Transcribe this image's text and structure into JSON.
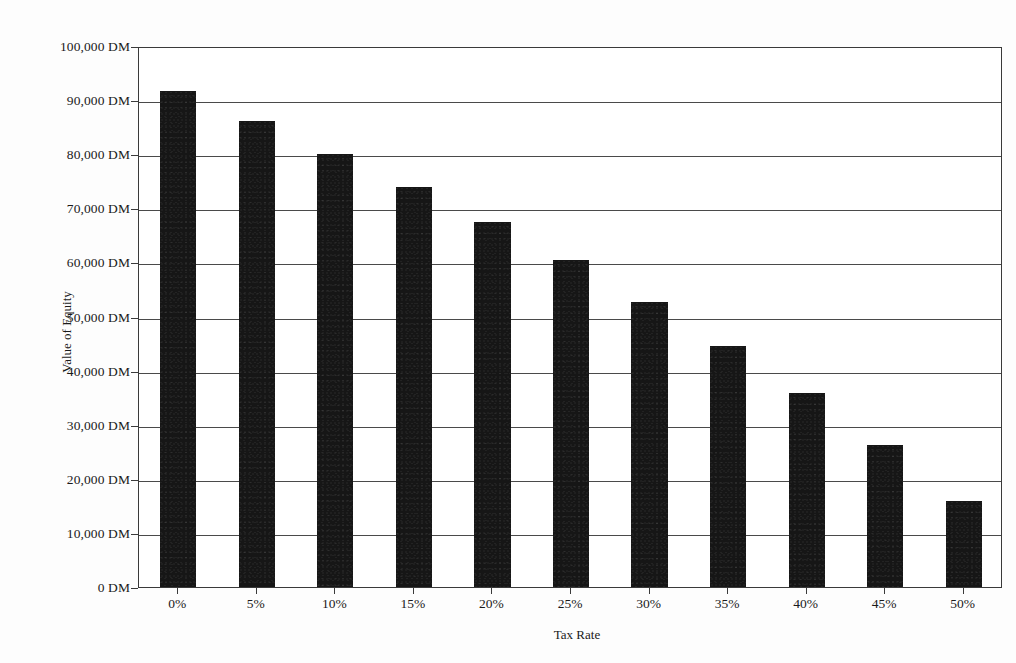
{
  "chart_data": {
    "type": "bar",
    "title": "",
    "subtitle": "",
    "xlabel": "Tax Rate",
    "ylabel": "Value of Equity",
    "categories": [
      "0%",
      "5%",
      "10%",
      "15%",
      "20%",
      "25%",
      "30%",
      "35%",
      "40%",
      "45%",
      "50%"
    ],
    "values": [
      91700,
      86100,
      80100,
      74000,
      67400,
      60400,
      52700,
      44500,
      35900,
      26300,
      15900
    ],
    "value_unit": "DM",
    "ylim": [
      0,
      100000
    ],
    "xlim_categories": 11,
    "ytick_values": [
      0,
      10000,
      20000,
      30000,
      40000,
      50000,
      60000,
      70000,
      80000,
      90000,
      100000
    ],
    "ytick_labels": [
      "0 DM",
      "10,000 DM",
      "20,000 DM",
      "30,000 DM",
      "40,000 DM",
      "50,000 DM",
      "60,000 DM",
      "70,000 DM",
      "80,000 DM",
      "90,000 DM",
      "100,000 DM"
    ],
    "grid": true,
    "grid_axis": "y",
    "legend": false,
    "legend_position": "none",
    "bar_color": "#161616",
    "axis_color": "#3a3a3a",
    "background_color": "#ffffff",
    "series": [
      {
        "name": "Value of Equity",
        "values": [
          91700,
          86100,
          80100,
          74000,
          67400,
          60400,
          52700,
          44500,
          35900,
          26300,
          15900
        ]
      }
    ]
  }
}
